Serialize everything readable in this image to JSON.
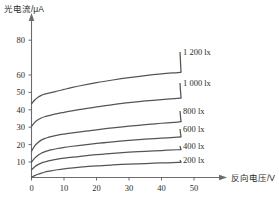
{
  "chart_data": {
    "type": "line",
    "title": "",
    "subtitle": "",
    "ylabel": "光电流/μA",
    "xlabel": "反向电压/V",
    "xlim": [
      0,
      57
    ],
    "ylim": [
      0,
      88
    ],
    "grid": false,
    "legend_position": "right-inline-labels",
    "x_ticks": [
      0,
      10,
      20,
      30,
      40,
      50
    ],
    "x_tick_labels": [
      "0",
      "10",
      "20",
      "30",
      "40",
      "50"
    ],
    "y_ticks": [
      10,
      20,
      30,
      40,
      50,
      60,
      80
    ],
    "y_tick_labels": [
      "10",
      "20",
      "30",
      "40",
      "50",
      "60",
      "80"
    ],
    "x": [
      0,
      1,
      2,
      3,
      4,
      5,
      6,
      8,
      10,
      12,
      15,
      20,
      25,
      30,
      35,
      40,
      45,
      46
    ],
    "series": [
      {
        "name": "1 200 lx",
        "label": "1 200 lx",
        "values": [
          47.5,
          50.0,
          51.8,
          53.0,
          53.8,
          54.3,
          54.8,
          55.8,
          56.8,
          57.8,
          59.2,
          61.2,
          62.9,
          64.4,
          65.7,
          66.8,
          67.7,
          67.9
        ]
      },
      {
        "name": "1 000 lx",
        "label": "1 000 lx",
        "values": [
          33.0,
          35.6,
          37.3,
          38.4,
          39.2,
          39.8,
          40.3,
          41.2,
          42.0,
          42.8,
          43.9,
          45.6,
          47.0,
          48.3,
          49.4,
          50.3,
          51.0,
          51.2
        ]
      },
      {
        "name": "800 lx",
        "label": "800 lx",
        "values": [
          17.0,
          20.4,
          22.6,
          24.1,
          25.1,
          25.8,
          26.4,
          27.3,
          28.0,
          28.6,
          29.4,
          30.8,
          32.0,
          33.1,
          34.1,
          35.0,
          35.8,
          36.0
        ]
      },
      {
        "name": "600 lx",
        "label": "600 lx",
        "values": [
          10.0,
          12.5,
          14.3,
          15.6,
          16.5,
          17.2,
          17.8,
          18.7,
          19.4,
          20.0,
          20.8,
          22.0,
          23.0,
          23.9,
          24.7,
          25.4,
          26.0,
          26.2
        ]
      },
      {
        "name": "400 lx",
        "label": "400 lx",
        "values": [
          5.0,
          6.9,
          8.3,
          9.3,
          10.0,
          10.6,
          11.1,
          11.9,
          12.5,
          13.0,
          13.7,
          14.7,
          15.6,
          16.3,
          16.9,
          17.4,
          17.9,
          18.0
        ]
      },
      {
        "name": "200 lx",
        "label": "200 lx",
        "values": [
          0.2,
          1.2,
          2.1,
          2.8,
          3.4,
          3.9,
          4.3,
          5.0,
          5.6,
          6.1,
          6.7,
          7.5,
          8.1,
          8.6,
          9.0,
          9.4,
          9.7,
          9.8
        ]
      }
    ]
  },
  "axes": {
    "y_label_text": "光电流/μA",
    "x_label_text": "反向电压/V"
  },
  "y_tick_labels": {
    "t10": "10",
    "t20": "20",
    "t30": "30",
    "t40": "40",
    "t50": "50",
    "t60": "60",
    "t80": "80"
  },
  "x_tick_labels": {
    "t0": "0",
    "t10": "10",
    "t20": "20",
    "t30": "30",
    "t40": "40",
    "t50": "50"
  },
  "series_labels": {
    "s1200": "1 200 lx",
    "s1000": "1 000 lx",
    "s800": "800 lx",
    "s600": "600 lx",
    "s400": "400 lx",
    "s200": "200 lx"
  }
}
